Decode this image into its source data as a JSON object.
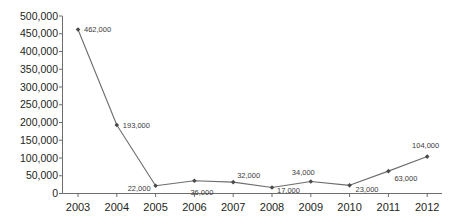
{
  "chart_data": {
    "type": "line",
    "title": "",
    "subtitle": "",
    "xlabel": "",
    "ylabel": "",
    "categories": [
      "2003",
      "2004",
      "2005",
      "2006",
      "2007",
      "2008",
      "2009",
      "2010",
      "2011",
      "2012"
    ],
    "values": [
      462000,
      193000,
      22000,
      36000,
      32000,
      17000,
      34000,
      23000,
      63000,
      104000
    ],
    "point_labels": [
      "462,000",
      "193,000",
      "22,000",
      "36,000",
      "32,000",
      "17,000",
      "34,000",
      "23,000",
      "63,000",
      "104,000"
    ],
    "ylim": [
      0,
      500000
    ],
    "y_ticks": [
      0,
      50000,
      100000,
      150000,
      200000,
      250000,
      300000,
      350000,
      400000,
      450000,
      500000
    ],
    "y_tick_labels": [
      "0",
      "50,000",
      "100,000",
      "150,000",
      "200,000",
      "250,000",
      "300,000",
      "350,000",
      "400,000",
      "450,000",
      "500,000"
    ],
    "grid": false,
    "legend": "none",
    "series": [
      {
        "name": "series-1",
        "values": [
          462000,
          193000,
          22000,
          36000,
          32000,
          17000,
          34000,
          23000,
          63000,
          104000
        ]
      }
    ],
    "colors": {
      "line": "#6d6d6d",
      "marker": "#4a4a4a",
      "axis": "#6d6d6d",
      "text": "#231f20",
      "label_text": "#3a3a3a",
      "background": "#ffffff"
    }
  },
  "label_placement": [
    {
      "anchor": "anchor-left",
      "dx": 6,
      "dy": 0
    },
    {
      "anchor": "anchor-left",
      "dx": 6,
      "dy": 0
    },
    {
      "anchor": "anchor-right",
      "dx": -5,
      "dy": 2
    },
    {
      "anchor": "anchor-left",
      "dx": -4,
      "dy": 11
    },
    {
      "anchor": "anchor-left",
      "dx": 4,
      "dy": -7
    },
    {
      "anchor": "anchor-left",
      "dx": 5,
      "dy": 3
    },
    {
      "anchor": "anchor-right",
      "dx": 4,
      "dy": -9
    },
    {
      "anchor": "anchor-left",
      "dx": 6,
      "dy": 4
    },
    {
      "anchor": "anchor-left",
      "dx": 6,
      "dy": 7
    },
    {
      "anchor": "anchor-right",
      "dx": 12,
      "dy": -12
    }
  ]
}
